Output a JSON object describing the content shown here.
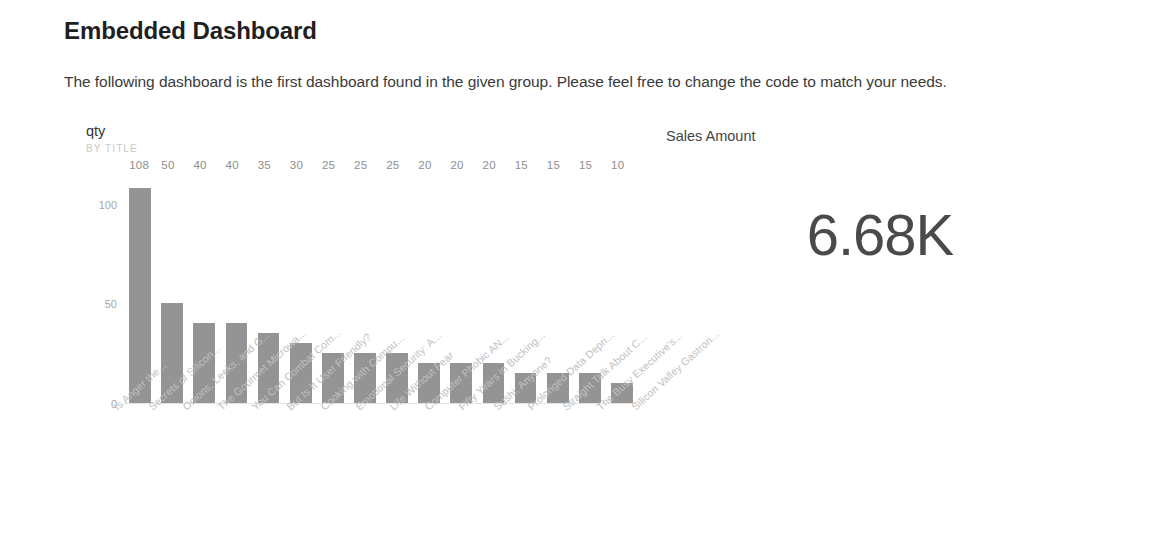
{
  "page": {
    "title": "Embedded Dashboard",
    "intro": "The following dashboard is the first dashboard found in the given group. Please feel free to change the code to match your needs."
  },
  "colors": {
    "bar": "#949494",
    "title_text": "#1f1f1f",
    "body_text": "#3a3a3a",
    "axis_text": "#a6a6a6",
    "category_text": "#c0c0c0",
    "card_value": "#4a4a4a",
    "baseline": "#e4e4e4"
  },
  "chart_tile": {
    "title": "qty",
    "subtitle": "BY TITLE"
  },
  "card_tile": {
    "title": "Sales Amount",
    "value": "6.68K"
  },
  "chart_data": {
    "type": "bar",
    "title": "qty",
    "subtitle": "BY TITLE",
    "xlabel": "",
    "ylabel": "",
    "ylim": [
      0,
      115
    ],
    "yticks": [
      0,
      50,
      100
    ],
    "ytick_labels": [
      "0",
      "50",
      "100"
    ],
    "grid": false,
    "legend": false,
    "data_labels": true,
    "category_label_rotation": -42,
    "categories": [
      "Is Anger the...",
      "Secrets of Silicon...",
      "Onions, Leeks, and G...",
      "The Gourmet Microwa...",
      "You Can Combat Com...",
      "But Is It User Friendly?",
      "Cooking with Compu...",
      "Emotional Security: A...",
      "Life Without Fear",
      "Computer Phobic AN...",
      "Fifty Years in Bucking...",
      "Sushi, Anyone?",
      "Prolonged Data Depri...",
      "Straight Talk About C...",
      "The Busy Executive's...",
      "Silicon Valley Gastron..."
    ],
    "values": [
      108,
      50,
      40,
      40,
      35,
      30,
      25,
      25,
      25,
      20,
      20,
      20,
      15,
      15,
      15,
      10
    ]
  }
}
